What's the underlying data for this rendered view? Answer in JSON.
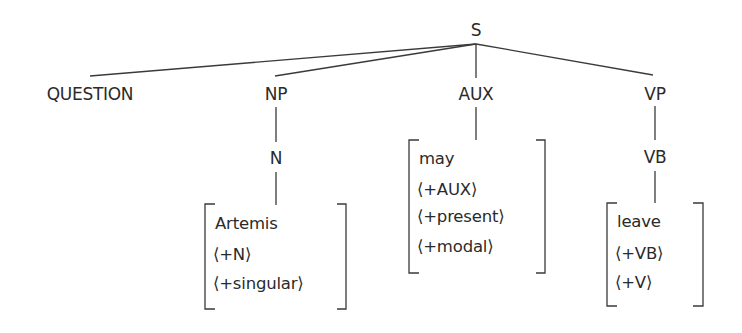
{
  "diagram": {
    "type": "syntax-tree",
    "root": {
      "label": "S"
    },
    "children": [
      {
        "label": "QUESTION"
      },
      {
        "label": "NP",
        "child": {
          "label": "N",
          "features": [
            "Artemis",
            "⟨+N⟩",
            "⟨+singular⟩"
          ]
        }
      },
      {
        "label": "AUX",
        "features": [
          "may",
          "⟨+AUX⟩",
          "⟨+present⟩",
          "⟨+modal⟩"
        ]
      },
      {
        "label": "VP",
        "child": {
          "label": "VB",
          "features": [
            "leave",
            "⟨+VB⟩",
            "⟨+V⟩"
          ]
        }
      }
    ]
  },
  "colors": {
    "line": "#3a3a3a",
    "text": "#2a2a2a",
    "background": "#ffffff"
  }
}
